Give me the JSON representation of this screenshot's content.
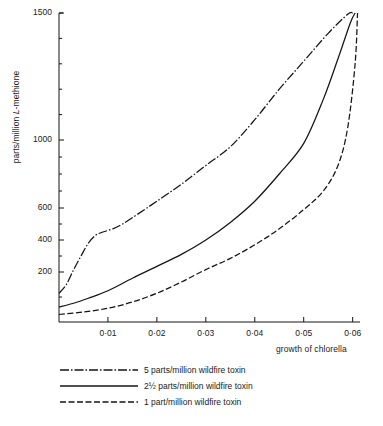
{
  "chart_data": {
    "type": "line",
    "title": "",
    "xlabel": "growth of chlorella",
    "ylabel": "parts/million L-methione",
    "ylabel_prefix": "parts/million ",
    "ylabel_italic": "L",
    "ylabel_suffix": "-methione",
    "xlim": [
      0,
      0.0615
    ],
    "ylim": [
      0,
      1500
    ],
    "y_scale_note": "non-linear (compressed at top)",
    "grid": false,
    "legend_position": "below-plot",
    "xticks": [
      {
        "value": 0.01,
        "label": "0·01"
      },
      {
        "value": 0.02,
        "label": "0·02"
      },
      {
        "value": 0.03,
        "label": "0·03"
      },
      {
        "value": 0.04,
        "label": "0·04"
      },
      {
        "value": 0.05,
        "label": "0·05"
      },
      {
        "value": 0.06,
        "label": "0·06"
      }
    ],
    "yticks": [
      {
        "value": 200,
        "label": "200"
      },
      {
        "value": 400,
        "label": "400"
      },
      {
        "value": 600,
        "label": "600"
      },
      {
        "value": 1000,
        "label": "1000"
      },
      {
        "value": 1500,
        "label": "1500"
      }
    ],
    "yminor": [
      100,
      300,
      500,
      700,
      800,
      900,
      1100,
      1200,
      1300,
      1400
    ],
    "series": [
      {
        "name": "5 parts/million wildfire toxin",
        "style": "dash-dot",
        "color": "#141414",
        "points": [
          [
            0.0,
            115
          ],
          [
            0.0015,
            150
          ],
          [
            0.003,
            215
          ],
          [
            0.0045,
            300
          ],
          [
            0.006,
            380
          ],
          [
            0.0075,
            430
          ],
          [
            0.009,
            450
          ],
          [
            0.011,
            470
          ],
          [
            0.013,
            500
          ],
          [
            0.016,
            560
          ],
          [
            0.02,
            640
          ],
          [
            0.025,
            740
          ],
          [
            0.03,
            850
          ],
          [
            0.035,
            960
          ],
          [
            0.04,
            1080
          ],
          [
            0.045,
            1200
          ],
          [
            0.05,
            1310
          ],
          [
            0.055,
            1420
          ],
          [
            0.059,
            1495
          ],
          [
            0.06,
            1500
          ]
        ]
      },
      {
        "name": "2½ parts/million wildfire toxin",
        "style": "solid",
        "color": "#141414",
        "points": [
          [
            0.0,
            60
          ],
          [
            0.003,
            75
          ],
          [
            0.006,
            95
          ],
          [
            0.01,
            125
          ],
          [
            0.015,
            175
          ],
          [
            0.02,
            235
          ],
          [
            0.025,
            310
          ],
          [
            0.03,
            400
          ],
          [
            0.035,
            510
          ],
          [
            0.04,
            640
          ],
          [
            0.045,
            800
          ],
          [
            0.05,
            980
          ],
          [
            0.054,
            1160
          ],
          [
            0.057,
            1320
          ],
          [
            0.0595,
            1460
          ],
          [
            0.0605,
            1500
          ]
        ]
      },
      {
        "name": "1 part/million wildfire toxin",
        "style": "dashed",
        "color": "#141414",
        "points": [
          [
            0.0,
            30
          ],
          [
            0.005,
            40
          ],
          [
            0.01,
            55
          ],
          [
            0.015,
            80
          ],
          [
            0.02,
            115
          ],
          [
            0.025,
            160
          ],
          [
            0.03,
            215
          ],
          [
            0.035,
            285
          ],
          [
            0.04,
            370
          ],
          [
            0.045,
            470
          ],
          [
            0.05,
            590
          ],
          [
            0.054,
            700
          ],
          [
            0.057,
            850
          ],
          [
            0.059,
            1050
          ],
          [
            0.0605,
            1300
          ],
          [
            0.061,
            1500
          ]
        ]
      }
    ]
  },
  "legend": {
    "items": [
      {
        "label": "5 parts/million wildfire toxin",
        "style": "dash-dot"
      },
      {
        "label": "2½ parts/million wildfire toxin",
        "style": "solid"
      },
      {
        "label": "1 part/million wildfire toxin",
        "style": "dashed"
      }
    ]
  }
}
